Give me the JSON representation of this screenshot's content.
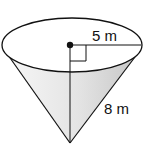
{
  "diagram": {
    "type": "cone",
    "orientation": "inverted (apex down)",
    "labels": {
      "radius": "5 m",
      "slant_height": "8 m"
    },
    "features": [
      "center-point",
      "radius-line",
      "height-line",
      "right-angle-marker",
      "shaded-lateral-surface"
    ],
    "colors": {
      "stroke": "#111111",
      "fill_light": "#f4f4f4",
      "fill_dark": "#cfcfcf",
      "background": "#ffffff"
    }
  }
}
